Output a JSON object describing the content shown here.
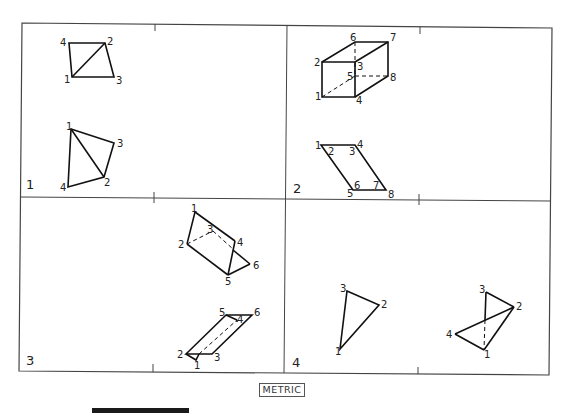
{
  "caption": "METRIC",
  "quadrants": [
    {
      "number": "1",
      "figures": [
        {
          "labels": [
            {
              "t": "4",
              "x": 60,
              "y": 46
            },
            {
              "t": "2",
              "x": 107,
              "y": 45
            },
            {
              "t": "1",
              "x": 64,
              "y": 83
            },
            {
              "t": "3",
              "x": 116,
              "y": 84
            }
          ]
        },
        {
          "labels": [
            {
              "t": "1",
              "x": 66,
              "y": 130
            },
            {
              "t": "3",
              "x": 117,
              "y": 147
            },
            {
              "t": "2",
              "x": 104,
              "y": 186
            },
            {
              "t": "4",
              "x": 60,
              "y": 191
            }
          ]
        }
      ]
    },
    {
      "number": "2",
      "figures": [
        {
          "labels": [
            {
              "t": "6",
              "x": 350,
              "y": 41
            },
            {
              "t": "7",
              "x": 390,
              "y": 41
            },
            {
              "t": "2",
              "x": 314,
              "y": 66
            },
            {
              "t": "3",
              "x": 357,
              "y": 70
            },
            {
              "t": "5",
              "x": 347,
              "y": 80
            },
            {
              "t": "8",
              "x": 390,
              "y": 81
            },
            {
              "t": "1",
              "x": 315,
              "y": 100
            },
            {
              "t": "4",
              "x": 356,
              "y": 104
            }
          ]
        },
        {
          "labels": [
            {
              "t": "1",
              "x": 315,
              "y": 149
            },
            {
              "t": "2",
              "x": 328,
              "y": 155
            },
            {
              "t": "3",
              "x": 349,
              "y": 155
            },
            {
              "t": "4",
              "x": 357,
              "y": 148
            },
            {
              "t": "6",
              "x": 354,
              "y": 189
            },
            {
              "t": "7",
              "x": 373,
              "y": 189
            },
            {
              "t": "5",
              "x": 347,
              "y": 197
            },
            {
              "t": "8",
              "x": 388,
              "y": 198
            }
          ]
        }
      ]
    },
    {
      "number": "3",
      "figures": [
        {
          "labels": [
            {
              "t": "1",
              "x": 191,
              "y": 212
            },
            {
              "t": "3",
              "x": 207,
              "y": 233
            },
            {
              "t": "2",
              "x": 178,
              "y": 248
            },
            {
              "t": "4",
              "x": 237,
              "y": 246
            },
            {
              "t": "6",
              "x": 253,
              "y": 269
            },
            {
              "t": "5",
              "x": 225,
              "y": 285
            }
          ]
        },
        {
          "labels": [
            {
              "t": "5",
              "x": 219,
              "y": 316
            },
            {
              "t": "6",
              "x": 254,
              "y": 316
            },
            {
              "t": "4",
              "x": 237,
              "y": 323
            },
            {
              "t": "2",
              "x": 177,
              "y": 358
            },
            {
              "t": "3",
              "x": 214,
              "y": 361
            },
            {
              "t": "1",
              "x": 194,
              "y": 369
            }
          ]
        }
      ]
    },
    {
      "number": "4",
      "figures": [
        {
          "labels": [
            {
              "t": "3",
              "x": 340,
              "y": 292
            },
            {
              "t": "2",
              "x": 381,
              "y": 308
            },
            {
              "t": "1",
              "x": 335,
              "y": 355
            }
          ]
        },
        {
          "labels": [
            {
              "t": "3",
              "x": 479,
              "y": 293
            },
            {
              "t": "2",
              "x": 516,
              "y": 310
            },
            {
              "t": "4",
              "x": 446,
              "y": 338
            },
            {
              "t": "1",
              "x": 484,
              "y": 358
            }
          ]
        }
      ]
    }
  ]
}
